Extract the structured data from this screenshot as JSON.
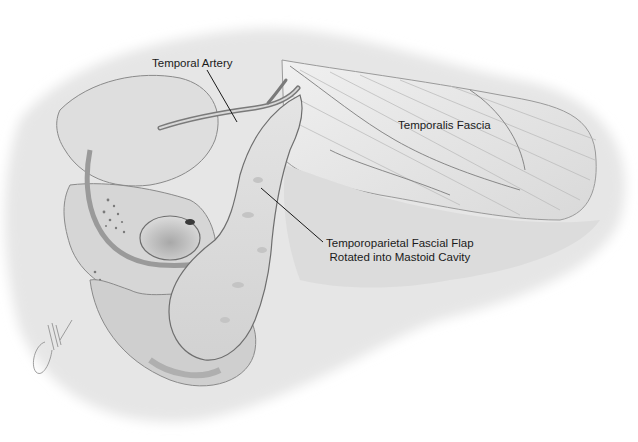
{
  "figure": {
    "type": "surgical-anatomical-illustration",
    "style": "grayscale pencil/airbrush",
    "background": "#ffffff",
    "tone_colors": {
      "light": "#eeeeee",
      "mid": "#cfcfcf",
      "dark": "#8a8a8a",
      "line": "#1a1a1a"
    }
  },
  "labels": [
    {
      "id": "temporal-artery",
      "text": "Temporal Artery",
      "leader": {
        "from": [
          207,
          70
        ],
        "to": [
          237,
          122
        ]
      }
    },
    {
      "id": "temporalis-fascia",
      "text": "Temporalis Fascia",
      "leader": null
    },
    {
      "id": "flap",
      "lines": [
        "Temporoparietal Fascial Flap",
        "Rotated into Mastoid Cavity"
      ],
      "leader": {
        "from": [
          261,
          188
        ],
        "to": [
          323,
          242
        ]
      }
    }
  ],
  "signature": {
    "present": true,
    "position": "bottom-left"
  }
}
